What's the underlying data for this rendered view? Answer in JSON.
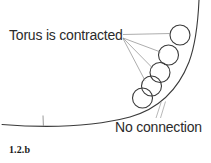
{
  "figure": {
    "caption": "1.2.b",
    "background_color": "#ffffff",
    "stroke_color": "#3a3a3a",
    "leader_color": "#8a8a8a",
    "text_color": "#2b2b2b",
    "width": 211,
    "height": 163,
    "annotations": [
      {
        "id": "torus-contracted",
        "text": "Torus is contracted",
        "x": 9,
        "y": 28,
        "leader_target_count": 4
      },
      {
        "id": "no-connection",
        "text": "No connection",
        "x": 115,
        "y": 120,
        "leader_target_count": 2
      }
    ],
    "circles": [
      {
        "cx": 180,
        "cy": 35,
        "r": 10
      },
      {
        "cx": 168.5,
        "cy": 55,
        "r": 10
      },
      {
        "cx": 160,
        "cy": 72.5,
        "r": 10
      },
      {
        "cx": 151.5,
        "cy": 86,
        "r": 10
      },
      {
        "cx": 142.5,
        "cy": 98,
        "r": 10
      }
    ],
    "curve": {
      "description": "hyperbolic-branch",
      "path": "M 2 124.5 C 40 127.5 90 127.5 130 117 C 158 109 178 90 189 62 C 195 46 198 22 199 0",
      "tick": {
        "x": 43,
        "y_top": 115.5,
        "y_bottom": 126
      }
    },
    "leaders_torus": [
      {
        "x1": 123,
        "y1": 34.5,
        "x2": 170.5,
        "y2": 33.5
      },
      {
        "x1": 123,
        "y1": 38,
        "x2": 160.5,
        "y2": 52
      },
      {
        "x1": 123,
        "y1": 38,
        "x2": 152.5,
        "y2": 68
      },
      {
        "x1": 123,
        "y1": 38.5,
        "x2": 145,
        "y2": 80.5
      }
    ],
    "leaders_noconnection": [
      {
        "x1": 156,
        "y1": 118,
        "x2": 161.5,
        "y2": 101
      },
      {
        "x1": 160.5,
        "y1": 118,
        "x2": 165.5,
        "y2": 101.5
      }
    ]
  }
}
